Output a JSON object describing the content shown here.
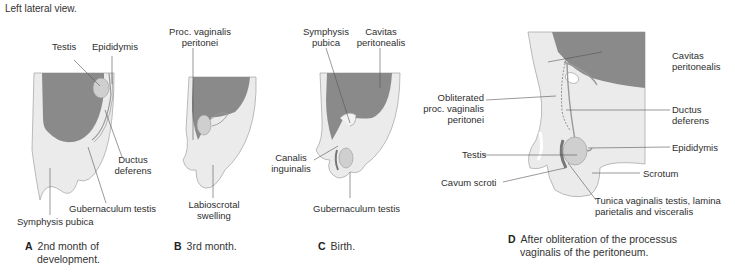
{
  "header": {
    "view_label": "Left lateral view."
  },
  "colors": {
    "peritoneal_cavity": "#8a8a8a",
    "tissue": "#e6e6e6",
    "tissue_light": "#f0f0f0",
    "testis": "#c8c8c8",
    "outline": "#9a9a9a",
    "leader_line": "#555555"
  },
  "panels": [
    {
      "id": "A",
      "letter": "A",
      "caption_line1": "2nd month of",
      "caption_line2": "development.",
      "labels": {
        "testis": "Testis",
        "epididymis": "Epididymis",
        "ductus_line1": "Ductus",
        "ductus_line2": "deferens",
        "gubernaculum": "Gubernaculum testis",
        "symphysis": "Symphysis pubica"
      }
    },
    {
      "id": "B",
      "letter": "B",
      "caption_line1": "3rd month.",
      "labels": {
        "proc_line1": "Proc. vaginalis",
        "proc_line2": "peritonei",
        "labio_line1": "Labioscrotal",
        "labio_line2": "swelling"
      }
    },
    {
      "id": "C",
      "letter": "C",
      "caption_line1": "Birth.",
      "labels": {
        "symphysis_line1": "Symphysis",
        "symphysis_line2": "pubica",
        "cavitas_line1": "Cavitas",
        "cavitas_line2": "peritonealis",
        "canalis_line1": "Canalis",
        "canalis_line2": "inguinalis",
        "gubernaculum": "Gubernaculum testis"
      }
    },
    {
      "id": "D",
      "letter": "D",
      "caption_line1": "After obliteration of the processus",
      "caption_line2": "vaginalis of the peritoneum.",
      "labels": {
        "cavitas_line1": "Cavitas",
        "cavitas_line2": "peritonealis",
        "oblit_line1": "Obliterated",
        "oblit_line2": "proc. vaginalis",
        "oblit_line3": "peritonei",
        "ductus_line1": "Ductus",
        "ductus_line2": "deferens",
        "testis": "Testis",
        "epididymis": "Epididymis",
        "cavum": "Cavum scroti",
        "scrotum": "Scrotum",
        "tunica_line1": "Tunica vaginalis testis, lamina",
        "tunica_line2": "parietalis and visceralis"
      }
    }
  ]
}
